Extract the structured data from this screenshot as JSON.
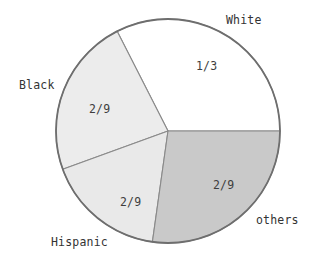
{
  "chart_data": {
    "type": "pie",
    "title": "",
    "subtitle": "",
    "xlabel": "",
    "ylabel": "",
    "legend_position": "none",
    "grid": false,
    "center": {
      "x": 168,
      "y": 131
    },
    "radius": 112,
    "categories": [
      "White",
      "Black",
      "Hispanic",
      "others"
    ],
    "values": [
      0.3333,
      0.2222,
      0.2222,
      0.2222
    ],
    "value_labels": [
      "1/3",
      "2/9",
      "2/9",
      "2/9"
    ],
    "slices": [
      {
        "name": "White",
        "label": "White",
        "value_label": "1/3",
        "value": 0.3333,
        "fraction_text": "1/3",
        "start_angle_deg": 0,
        "end_angle_deg": 117,
        "fill": "#ffffff",
        "stroke": "#6e6e6e",
        "label_x": 226,
        "label_y": 14,
        "value_x": 196,
        "value_y": 60
      },
      {
        "name": "Black",
        "label": "Black",
        "value_label": "2/9",
        "value": 0.2222,
        "fraction_text": "2/9",
        "start_angle_deg": 117,
        "end_angle_deg": 200,
        "fill": "#ececec",
        "stroke": "#6e6e6e",
        "label_x": 19,
        "label_y": 79,
        "value_x": 89,
        "value_y": 103
      },
      {
        "name": "Hispanic",
        "label": "Hispanic",
        "value_label": "2/9",
        "value": 0.2222,
        "fraction_text": "2/9",
        "start_angle_deg": 200,
        "end_angle_deg": 262,
        "fill": "#e9e9e9",
        "stroke": "#6e6e6e",
        "label_x": 51,
        "label_y": 236,
        "value_x": 120,
        "value_y": 196
      },
      {
        "name": "others",
        "label": "others",
        "value_label": "2/9",
        "value": 0.2222,
        "fraction_text": "2/9",
        "start_angle_deg": 262,
        "end_angle_deg": 360,
        "fill": "#c9c9c9",
        "stroke": "#6e6e6e",
        "label_x": 256,
        "label_y": 214,
        "value_x": 213,
        "value_y": 179
      }
    ],
    "colors": {
      "outline": "#6e6e6e",
      "divider": "#8a8a8a",
      "text": "#333333",
      "background": "#ffffff"
    }
  }
}
